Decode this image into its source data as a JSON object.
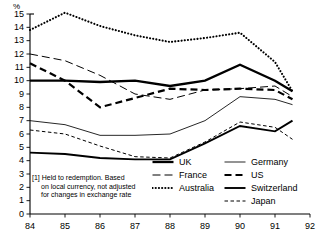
{
  "axis": {
    "y_unit_label": "%",
    "y_ticks": [
      "15",
      "14",
      "13",
      "12",
      "11",
      "10",
      "9",
      "8",
      "7",
      "6",
      "5",
      "4",
      "3",
      "2",
      "1",
      "0"
    ],
    "x_ticks": [
      "84",
      "85",
      "86",
      "87",
      "88",
      "89",
      "90",
      "91",
      "92"
    ]
  },
  "footnote": {
    "line1": "[1]  Held to redemption. Based",
    "line2": "on local currency, not adjusted",
    "line3": "for changes in exchange rate"
  },
  "legend": {
    "left": [
      {
        "label": "UK",
        "key": "uk"
      },
      {
        "label": "France",
        "key": "france"
      },
      {
        "label": "Australia",
        "key": "australia"
      }
    ],
    "right": [
      {
        "label": "Germany",
        "key": "germany"
      },
      {
        "label": "US",
        "key": "us"
      },
      {
        "label": "Switzerland",
        "key": "switzerland"
      },
      {
        "label": "Japan",
        "key": "japan"
      }
    ]
  },
  "chart_data": {
    "type": "line",
    "title": "",
    "xlabel": "",
    "ylabel": "%",
    "xlim": [
      84,
      92
    ],
    "ylim": [
      0,
      15
    ],
    "grid": false,
    "legend_position": "bottom-right",
    "x": [
      84,
      85,
      86,
      87,
      88,
      89,
      90,
      91,
      91.5
    ],
    "series": [
      {
        "name": "UK",
        "style": "solid-thick",
        "color": "#000000",
        "values": [
          10.0,
          10.0,
          9.9,
          10.0,
          9.6,
          10.0,
          11.2,
          10.0,
          9.2
        ]
      },
      {
        "name": "France",
        "style": "dashed-long",
        "color": "#000000",
        "values": [
          12.0,
          11.5,
          10.4,
          9.0,
          8.6,
          9.3,
          9.4,
          9.6,
          8.8
        ]
      },
      {
        "name": "Australia",
        "style": "dotted",
        "color": "#000000",
        "values": [
          13.8,
          15.1,
          14.1,
          13.4,
          12.9,
          13.2,
          13.6,
          11.4,
          9.2
        ]
      },
      {
        "name": "Germany",
        "style": "solid-thin",
        "color": "#000000",
        "values": [
          7.0,
          6.7,
          5.9,
          5.9,
          6.0,
          7.0,
          8.8,
          8.6,
          8.2
        ]
      },
      {
        "name": "US",
        "style": "dashed-thick",
        "color": "#000000",
        "values": [
          11.3,
          10.0,
          8.0,
          8.7,
          9.4,
          9.3,
          9.4,
          9.3,
          8.6
        ]
      },
      {
        "name": "Switzerland",
        "style": "solid-medium",
        "color": "#000000",
        "values": [
          4.6,
          4.5,
          4.2,
          4.1,
          4.1,
          5.3,
          6.6,
          6.2,
          7.0
        ]
      },
      {
        "name": "Japan",
        "style": "dashed-short",
        "color": "#000000",
        "values": [
          6.3,
          6.0,
          5.1,
          4.3,
          4.2,
          5.4,
          6.9,
          6.5,
          5.6
        ]
      }
    ]
  }
}
